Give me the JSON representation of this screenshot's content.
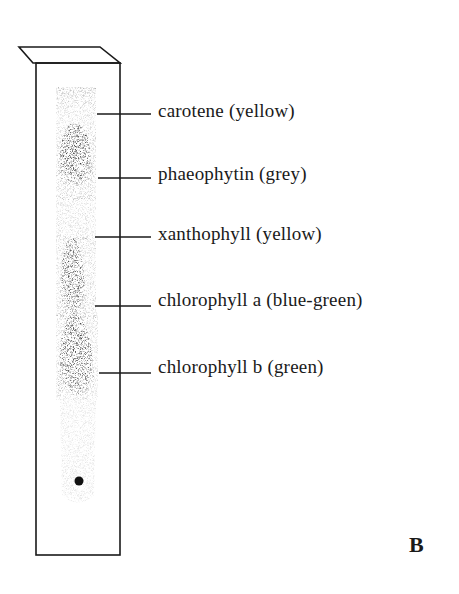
{
  "figure": {
    "panel_label": "B",
    "colors": {
      "ink": "#1a1a1a",
      "background": "#ffffff"
    },
    "bands": [
      {
        "label": "carotene (yellow)",
        "line_y": 114,
        "label_top": 100
      },
      {
        "label": "phaeophytin (grey)",
        "line_y": 178,
        "label_top": 163
      },
      {
        "label": "xanthophyll (yellow)",
        "line_y": 237,
        "label_top": 223
      },
      {
        "label": "chlorophyll a (blue-green)",
        "line_y": 306,
        "label_top": 288
      },
      {
        "label": "chlorophyll b (green)",
        "line_y": 373,
        "label_top": 355
      }
    ],
    "origin_spot": {
      "label": "origin spot"
    }
  }
}
